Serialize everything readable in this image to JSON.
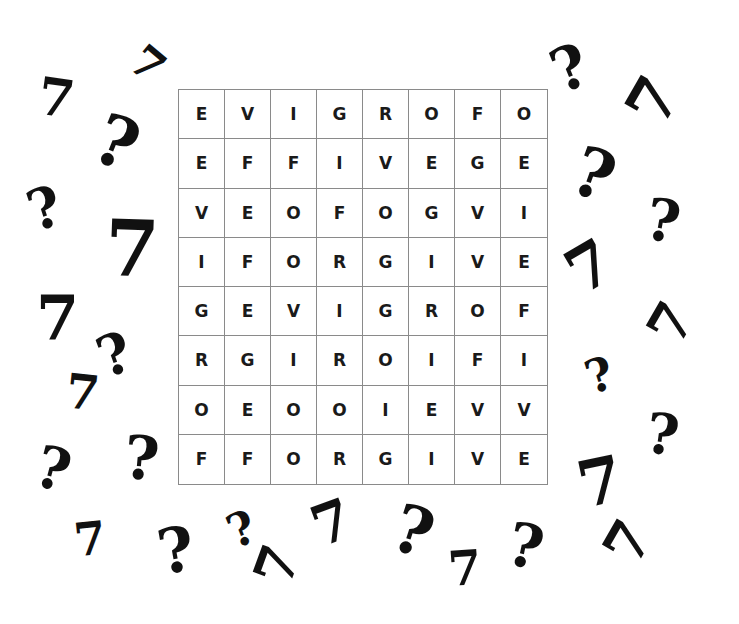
{
  "puzzle": {
    "type": "word-search",
    "rows": 8,
    "cols": 8,
    "grid": [
      [
        "E",
        "V",
        "I",
        "G",
        "R",
        "O",
        "F",
        "O"
      ],
      [
        "E",
        "F",
        "F",
        "I",
        "V",
        "E",
        "G",
        "E"
      ],
      [
        "V",
        "E",
        "O",
        "F",
        "O",
        "G",
        "V",
        "I"
      ],
      [
        "I",
        "F",
        "O",
        "R",
        "G",
        "I",
        "V",
        "E"
      ],
      [
        "G",
        "E",
        "V",
        "I",
        "G",
        "R",
        "O",
        "F"
      ],
      [
        "R",
        "G",
        "I",
        "R",
        "O",
        "I",
        "F",
        "I"
      ],
      [
        "O",
        "E",
        "O",
        "O",
        "I",
        "E",
        "V",
        "V"
      ],
      [
        "F",
        "F",
        "O",
        "R",
        "G",
        "I",
        "V",
        "E"
      ]
    ]
  },
  "decorations": [
    {
      "glyph": "7",
      "x": 38,
      "y": 72,
      "size": 52,
      "rot": 8
    },
    {
      "glyph": "7",
      "x": 132,
      "y": 42,
      "size": 44,
      "rot": 40
    },
    {
      "glyph": "?",
      "x": 96,
      "y": 108,
      "size": 70,
      "rot": 22
    },
    {
      "glyph": "?",
      "x": 28,
      "y": 180,
      "size": 56,
      "rot": -18
    },
    {
      "glyph": "7",
      "x": 105,
      "y": 210,
      "size": 78,
      "rot": 2
    },
    {
      "glyph": "7",
      "x": 36,
      "y": 288,
      "size": 62,
      "rot": 0
    },
    {
      "glyph": "?",
      "x": 98,
      "y": 326,
      "size": 56,
      "rot": -20
    },
    {
      "glyph": "7",
      "x": 66,
      "y": 368,
      "size": 48,
      "rot": 6
    },
    {
      "glyph": "?",
      "x": 36,
      "y": 440,
      "size": 58,
      "rot": 15
    },
    {
      "glyph": "?",
      "x": 124,
      "y": 428,
      "size": 60,
      "rot": 5
    },
    {
      "glyph": "7",
      "x": 74,
      "y": 516,
      "size": 46,
      "rot": -6
    },
    {
      "glyph": "?",
      "x": 158,
      "y": 520,
      "size": 62,
      "rot": -10
    },
    {
      "glyph": "?",
      "x": 228,
      "y": 506,
      "size": 46,
      "rot": -22
    },
    {
      "glyph": "7",
      "x": 258,
      "y": 538,
      "size": 54,
      "rot": -70
    },
    {
      "glyph": "7",
      "x": 312,
      "y": 494,
      "size": 56,
      "rot": -20
    },
    {
      "glyph": "?",
      "x": 394,
      "y": 498,
      "size": 66,
      "rot": 18
    },
    {
      "glyph": "7",
      "x": 448,
      "y": 544,
      "size": 48,
      "rot": -4
    },
    {
      "glyph": "?",
      "x": 508,
      "y": 516,
      "size": 60,
      "rot": 12
    },
    {
      "glyph": "?",
      "x": 552,
      "y": 38,
      "size": 60,
      "rot": -22
    },
    {
      "glyph": "7",
      "x": 632,
      "y": 70,
      "size": 62,
      "rot": -60
    },
    {
      "glyph": "?",
      "x": 574,
      "y": 140,
      "size": 68,
      "rot": 20
    },
    {
      "glyph": "?",
      "x": 646,
      "y": 192,
      "size": 58,
      "rot": 10
    },
    {
      "glyph": "7",
      "x": 568,
      "y": 236,
      "size": 62,
      "rot": -30
    },
    {
      "glyph": "7",
      "x": 652,
      "y": 296,
      "size": 54,
      "rot": -60
    },
    {
      "glyph": "?",
      "x": 586,
      "y": 352,
      "size": 46,
      "rot": -18
    },
    {
      "glyph": "?",
      "x": 646,
      "y": 406,
      "size": 56,
      "rot": 8
    },
    {
      "glyph": "7",
      "x": 578,
      "y": 450,
      "size": 64,
      "rot": -12
    },
    {
      "glyph": "7",
      "x": 608,
      "y": 514,
      "size": 56,
      "rot": -60
    }
  ]
}
